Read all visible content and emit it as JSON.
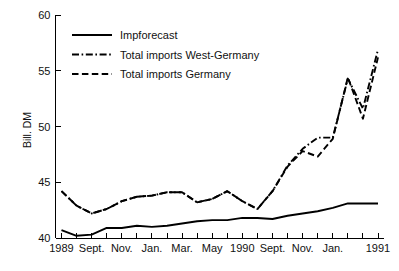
{
  "chart_data": {
    "type": "line",
    "title": "",
    "xlabel": "",
    "ylabel": "Bill. DM",
    "ylim": [
      40,
      60
    ],
    "yticks": [
      40,
      45,
      50,
      55,
      60
    ],
    "grid": false,
    "legend_position": "top-left",
    "x": [
      "1989-07",
      "1989-08",
      "1989-09",
      "1989-10",
      "1989-11",
      "1989-12",
      "1990-01",
      "1990-02",
      "1990-03",
      "1990-04",
      "1990-05",
      "1990-06",
      "1990-07",
      "1990-08",
      "1990-09",
      "1990-10",
      "1990-11",
      "1990-12",
      "1991-01",
      "1991-02",
      "1991-03",
      "1991-04"
    ],
    "xtick_labels": [
      "1989",
      "",
      "Sept.",
      "",
      "Nov.",
      "",
      "Jan.",
      "",
      "Mar.",
      "",
      "May",
      "",
      "1990",
      "",
      "Sept.",
      "",
      "Nov.",
      "",
      "Jan.",
      "",
      "",
      "1991"
    ],
    "xtick_major": [
      "1989",
      "Sept.",
      "Nov.",
      "Jan.",
      "Mar.",
      "May",
      "1990",
      "Sept.",
      "Nov.",
      "Jan.",
      "1991"
    ],
    "series": [
      {
        "name": "Impforecast",
        "style": "solid",
        "values": [
          40.7,
          40.2,
          40.3,
          40.9,
          40.9,
          41.1,
          41.0,
          41.1,
          41.3,
          41.5,
          41.6,
          41.6,
          41.8,
          41.8,
          41.7,
          42.0,
          42.2,
          42.4,
          42.7,
          43.1,
          43.1,
          43.1
        ]
      },
      {
        "name": "Total imports West-Germany",
        "style": "dash-dot",
        "values": [
          44.2,
          42.9,
          42.2,
          42.6,
          43.3,
          43.7,
          43.8,
          44.1,
          44.1,
          43.2,
          43.5,
          44.2,
          43.3,
          42.6,
          44.2,
          46.5,
          48.0,
          49.0,
          49.0,
          54.3,
          51.6,
          56.9
        ],
        "note": "dash-dot branch coincides with Germany series until mid-1990, then runs slightly above"
      },
      {
        "name": "Total imports Germany",
        "style": "dashed",
        "values": [
          44.2,
          42.9,
          42.2,
          42.6,
          43.3,
          43.7,
          43.8,
          44.1,
          44.1,
          43.2,
          43.5,
          44.2,
          43.3,
          42.6,
          44.2,
          46.4,
          47.8,
          47.3,
          48.9,
          54.4,
          50.7,
          56.2
        ]
      }
    ]
  },
  "legend": {
    "items": [
      {
        "label": "Impforecast",
        "style": "solid"
      },
      {
        "label": "Total imports West-Germany",
        "style": "dash-dot"
      },
      {
        "label": "Total imports Germany",
        "style": "dashed"
      }
    ]
  },
  "axis": {
    "y_title": "Bill. DM",
    "y_ticks": [
      "60",
      "55",
      "50",
      "45",
      "40"
    ],
    "x_ticks": [
      "1989",
      "Sept.",
      "Nov.",
      "Jan.",
      "Mar.",
      "May",
      "1990",
      "Sept.",
      "Nov.",
      "Jan.",
      "1991"
    ]
  },
  "colors": {
    "line": "#000000",
    "background": "#ffffff",
    "text": "#111111"
  }
}
